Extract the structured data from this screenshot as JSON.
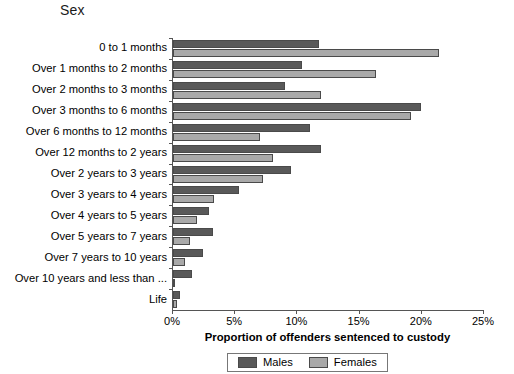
{
  "chart_data": {
    "type": "bar",
    "orientation": "horizontal",
    "title": "Sex",
    "xlabel": "Proportion of offenders sentenced to custody",
    "ylabel": "",
    "xlim": [
      0,
      25
    ],
    "xticks": [
      "0%",
      "5%",
      "10%",
      "15%",
      "20%",
      "25%"
    ],
    "xtick_values": [
      0,
      5,
      10,
      15,
      20,
      25
    ],
    "grid": false,
    "legend_position": "bottom",
    "categories": [
      "0 to 1 months",
      "Over 1 months to 2 months",
      "Over 2 months to 3 months",
      "Over 3 months to 6 months",
      "Over 6 months to 12 months",
      "Over 12 months to 2 years",
      "Over 2 years to 3 years",
      "Over 3 years to 4 years",
      "Over 4 years to 5 years",
      "Over 5 years to 7 years",
      "Over 7 years to 10 years",
      "Over 10 years and less than ...",
      "Life"
    ],
    "series": [
      {
        "name": "Males",
        "color": "#595959",
        "values": [
          11.7,
          10.4,
          9.0,
          19.9,
          11.0,
          11.9,
          9.5,
          5.3,
          2.9,
          3.2,
          2.4,
          1.5,
          0.6
        ]
      },
      {
        "name": "Females",
        "color": "#a9a9a9",
        "values": [
          21.4,
          16.3,
          11.9,
          19.1,
          7.0,
          8.0,
          7.2,
          3.3,
          1.9,
          1.4,
          1.0,
          0.2,
          0.3
        ]
      }
    ]
  }
}
